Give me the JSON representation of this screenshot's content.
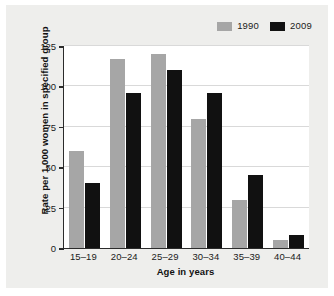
{
  "chart_data": {
    "type": "bar",
    "title": "",
    "subtitle": "",
    "xlabel": "Age in years",
    "ylabel": "Rate per 1,000 women in specified group",
    "categories": [
      "15–19",
      "20–24",
      "25–29",
      "30–34",
      "35–39",
      "40–44"
    ],
    "series": [
      {
        "name": "1990",
        "color": "#a6a6a6",
        "values": [
          60,
          117,
          120,
          80,
          30,
          5
        ]
      },
      {
        "name": "2009",
        "color": "#111111",
        "values": [
          40,
          96,
          110,
          96,
          45,
          8
        ]
      }
    ],
    "ylim": [
      0,
      125
    ],
    "yticks": [
      0,
      25,
      50,
      75,
      100,
      125
    ],
    "ytick_labels": [
      "0",
      "25",
      "50",
      "75",
      "100",
      "125"
    ],
    "grid": "horizontal",
    "legend_position": "top-right"
  },
  "colors": {
    "figure_background": "#eeeeec",
    "plot_background": "#ffffff",
    "axis": "#2b2b2b",
    "gridline": "#d9d9d9",
    "text": "#1a1a1a"
  }
}
